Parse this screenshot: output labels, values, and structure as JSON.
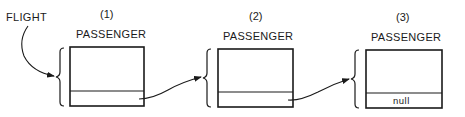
{
  "diagram": {
    "pointer_label": "FLIGHT",
    "nodes": [
      {
        "index": "(1)",
        "type_label": "PASSENGER",
        "next_value": ""
      },
      {
        "index": "(2)",
        "type_label": "PASSENGER",
        "next_value": ""
      },
      {
        "index": "(3)",
        "type_label": "PASSENGER",
        "next_value": "null"
      }
    ]
  }
}
